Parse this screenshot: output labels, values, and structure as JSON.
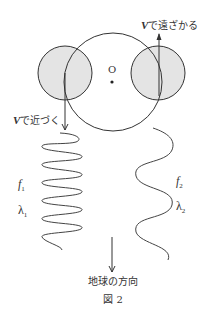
{
  "figure": {
    "caption": "図 2",
    "center_label": "O",
    "earth_direction_label": "地球の方向",
    "approaching": {
      "speed": "V",
      "text": "で近づく"
    },
    "receding": {
      "speed": "V",
      "text": "で遠ざかる"
    },
    "left_wave": {
      "freq": "f",
      "freq_sub": "1",
      "wavelength": "λ",
      "wavelength_sub": "1"
    },
    "right_wave": {
      "freq": "f",
      "freq_sub": "2",
      "wavelength": "λ",
      "wavelength_sub": "2"
    },
    "colors": {
      "stroke": "#333333",
      "star_fill": "#e4e4e4",
      "background": "#ffffff"
    }
  }
}
